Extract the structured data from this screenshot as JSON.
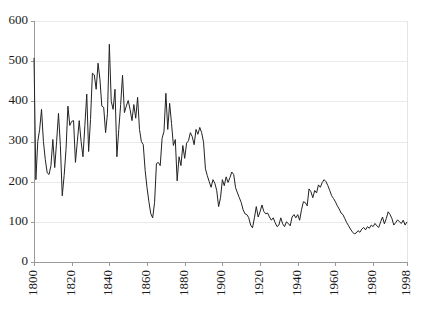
{
  "chart_data": {
    "type": "line",
    "title": "",
    "subtitle": "",
    "xlabel": "",
    "ylabel": "",
    "xlim": [
      1800,
      1998
    ],
    "ylim": [
      0,
      600
    ],
    "grid": true,
    "legend": false,
    "legend_position": "none",
    "line_color": "#222222",
    "grid_color": "#e9e9e9",
    "axis_color": "#9a9a9a",
    "background_color": "#ffffff",
    "y_ticks": [
      0,
      100,
      200,
      300,
      400,
      500,
      600
    ],
    "y_tick_labels": [
      "0",
      "100",
      "200",
      "300",
      "400",
      "500",
      "600"
    ],
    "x_ticks": [
      1800,
      1820,
      1840,
      1860,
      1880,
      1900,
      1920,
      1940,
      1960,
      1980,
      1998
    ],
    "x_tick_labels": [
      "1800",
      "1820",
      "1840",
      "1860",
      "1880",
      "1900",
      "1920",
      "1940",
      "1960",
      "1980",
      "1998"
    ],
    "x_tick_label_rotation": -90,
    "series": [
      {
        "name": "series-1",
        "x": [
          1800,
          1801,
          1802,
          1803,
          1804,
          1805,
          1806,
          1807,
          1808,
          1809,
          1810,
          1811,
          1812,
          1813,
          1814,
          1815,
          1816,
          1817,
          1818,
          1819,
          1820,
          1821,
          1822,
          1823,
          1824,
          1825,
          1826,
          1827,
          1828,
          1829,
          1830,
          1831,
          1832,
          1833,
          1834,
          1835,
          1836,
          1837,
          1838,
          1839,
          1840,
          1841,
          1842,
          1843,
          1844,
          1845,
          1846,
          1847,
          1848,
          1849,
          1850,
          1851,
          1852,
          1853,
          1854,
          1855,
          1856,
          1857,
          1858,
          1859,
          1860,
          1861,
          1862,
          1863,
          1864,
          1865,
          1866,
          1867,
          1868,
          1869,
          1870,
          1871,
          1872,
          1873,
          1874,
          1875,
          1876,
          1877,
          1878,
          1879,
          1880,
          1881,
          1882,
          1883,
          1884,
          1885,
          1886,
          1887,
          1888,
          1889,
          1890,
          1891,
          1892,
          1893,
          1894,
          1895,
          1896,
          1897,
          1898,
          1899,
          1900,
          1901,
          1902,
          1903,
          1904,
          1905,
          1906,
          1907,
          1908,
          1909,
          1910,
          1911,
          1912,
          1913,
          1914,
          1915,
          1916,
          1917,
          1918,
          1919,
          1920,
          1921,
          1922,
          1923,
          1924,
          1925,
          1926,
          1927,
          1928,
          1929,
          1930,
          1931,
          1932,
          1933,
          1934,
          1935,
          1936,
          1937,
          1938,
          1939,
          1940,
          1941,
          1942,
          1943,
          1944,
          1945,
          1946,
          1947,
          1948,
          1949,
          1950,
          1951,
          1952,
          1953,
          1954,
          1955,
          1956,
          1957,
          1958,
          1959,
          1960,
          1961,
          1962,
          1963,
          1964,
          1965,
          1966,
          1967,
          1968,
          1969,
          1970,
          1971,
          1972,
          1973,
          1974,
          1975,
          1976,
          1977,
          1978,
          1979,
          1980,
          1981,
          1982,
          1983,
          1984,
          1985,
          1986,
          1987,
          1988,
          1989,
          1990,
          1991,
          1992,
          1993,
          1994,
          1995,
          1996,
          1997,
          1998
        ],
        "values": [
          508,
          205,
          300,
          330,
          380,
          300,
          255,
          222,
          218,
          240,
          305,
          235,
          300,
          370,
          290,
          165,
          215,
          280,
          388,
          340,
          350,
          352,
          248,
          300,
          352,
          300,
          262,
          340,
          418,
          275,
          355,
          470,
          466,
          430,
          495,
          455,
          388,
          385,
          322,
          370,
          542,
          400,
          380,
          430,
          262,
          330,
          392,
          465,
          372,
          388,
          402,
          380,
          352,
          392,
          358,
          410,
          330,
          300,
          292,
          228,
          185,
          150,
          120,
          110,
          148,
          245,
          248,
          240,
          308,
          325,
          420,
          330,
          395,
          345,
          290,
          305,
          202,
          262,
          240,
          290,
          258,
          296,
          302,
          322,
          312,
          292,
          330,
          318,
          335,
          322,
          298,
          232,
          215,
          200,
          186,
          205,
          196,
          178,
          138,
          160,
          205,
          190,
          212,
          198,
          210,
          224,
          218,
          185,
          172,
          160,
          148,
          130,
          120,
          118,
          110,
          92,
          85,
          110,
          138,
          112,
          125,
          142,
          126,
          120,
          122,
          112,
          104,
          110,
          98,
          88,
          92,
          110,
          95,
          88,
          100,
          96,
          90,
          112,
          118,
          110,
          118,
          104,
          130,
          150,
          148,
          140,
          182,
          175,
          160,
          178,
          172,
          192,
          186,
          198,
          205,
          200,
          190,
          178,
          165,
          158,
          150,
          140,
          132,
          122,
          118,
          108,
          98,
          90,
          82,
          75,
          70,
          72,
          78,
          74,
          82,
          86,
          80,
          88,
          84,
          92,
          88,
          96,
          90,
          86,
          100,
          112,
          95,
          108,
          125,
          118,
          108,
          92,
          98,
          105,
          100,
          96,
          104,
          92,
          100
        ]
      }
    ]
  },
  "geometry": {
    "plot_left": 34,
    "plot_right": 407,
    "plot_top": 21,
    "plot_bottom": 262
  }
}
